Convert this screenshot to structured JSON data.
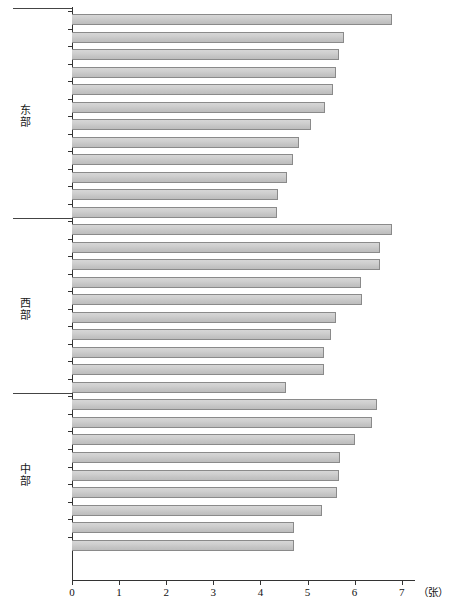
{
  "chart_data": {
    "type": "bar",
    "orientation": "horizontal",
    "title": "",
    "xlabel": "（张）",
    "ylabel": "",
    "xlim": [
      0,
      7
    ],
    "xticks": [
      0,
      1,
      2,
      3,
      4,
      5,
      6,
      7
    ],
    "xtick_labels": [
      "0",
      "1",
      "2",
      "3",
      "4",
      "5",
      "6",
      "7"
    ],
    "grid": false,
    "legend": false,
    "bar_color": "#c8c8c8",
    "bar_edge_color": "#8a8a8a",
    "groups": [
      {
        "name": "东部",
        "categories": [
          "辽宁",
          "江苏",
          "山东",
          "北京",
          "上海",
          "浙江",
          "河北",
          "广西",
          "福建",
          "海南",
          "广东",
          "天津"
        ],
        "values": [
          6.8,
          5.77,
          5.66,
          5.6,
          5.54,
          5.37,
          5.07,
          4.82,
          4.69,
          4.56,
          4.37,
          4.35
        ]
      },
      {
        "name": "西部",
        "categories": [
          "新疆",
          "四川",
          "重庆",
          "贵州",
          "陕西",
          "宁夏",
          "云南",
          "甘肃",
          "青海",
          "西藏"
        ],
        "values": [
          6.8,
          6.54,
          6.54,
          6.14,
          6.16,
          5.6,
          5.5,
          5.35,
          5.35,
          4.54
        ]
      },
      {
        "name": "中部",
        "categories": [
          "湖南",
          "湖北",
          "黑龙江",
          "吉林",
          "内蒙古",
          "河南",
          "山西",
          "江西",
          "安徽"
        ],
        "values": [
          6.48,
          6.37,
          6.01,
          5.69,
          5.66,
          5.63,
          5.31,
          4.71,
          4.71
        ]
      }
    ]
  },
  "axis": {
    "unit_label": "（张）"
  }
}
